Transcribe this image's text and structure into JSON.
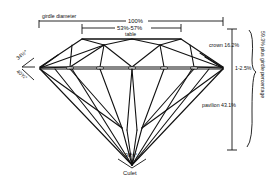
{
  "diagram": {
    "labels": {
      "girdle_diameter": "girdle diameter",
      "total_width": "100%",
      "table_range": "53%-57%",
      "table": "table",
      "crown": "crown 16.2%",
      "girdle": "1-2.5%",
      "pavilion": "pavilion 43.1%",
      "total_depth": "59.3% plus girdle percentage",
      "crown_angle": "34½°",
      "pavilion_angle": "40¾°",
      "culet_angle": "98½°",
      "culet": "Culet"
    },
    "colors": {
      "ink": "#111111",
      "background": "#ffffff"
    }
  }
}
